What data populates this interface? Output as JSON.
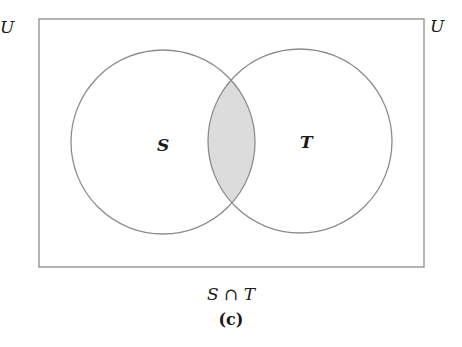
{
  "diagram": {
    "type": "venn",
    "universe_label": "U",
    "universe_label_left": "U",
    "sets": [
      {
        "name": "S",
        "label": "S"
      },
      {
        "name": "T",
        "label": "T"
      }
    ],
    "shaded_region": "S ∩ T",
    "caption_expression": "S ∩ T",
    "caption_tag": "(c)",
    "colors": {
      "outline": "#8c8c8c",
      "shade": "#dcdcdc",
      "background": "#ffffff",
      "text": "#1a1a1a"
    }
  }
}
